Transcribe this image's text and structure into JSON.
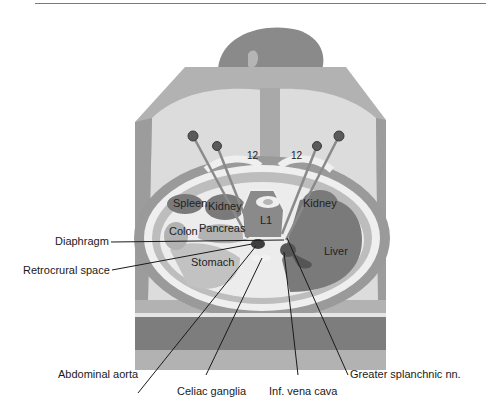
{
  "figure": {
    "type": "anatomical-diagram",
    "colors": {
      "background": "#ffffff",
      "body_outline": "#9a9a9a",
      "skin": "#d6d6d6",
      "organ_dark": "#6e6e6e",
      "organ_mid": "#8c8c8c",
      "fat_light": "#e8e8e8",
      "table_band": "#7d7d7d",
      "leader_line": "#1a1a1a"
    }
  },
  "in_figure_labels": {
    "rib_left": "12",
    "rib_right": "12",
    "vertebra": "L1",
    "spleen": "Spleen",
    "kidney_left": "Kidney",
    "kidney_right": "Kidney",
    "colon": "Colon",
    "pancreas": "Pancreas",
    "stomach": "Stomach",
    "liver": "Liver"
  },
  "callouts": {
    "diaphragm": "Diaphragm",
    "retrocrural_space": "Retrocrural space",
    "abdominal_aorta": "Abdominal aorta",
    "celiac_ganglia": "Celiac ganglia",
    "inf_vena_cava": "Inf. vena cava",
    "greater_splanchnic": "Greater splanchnic nn."
  }
}
